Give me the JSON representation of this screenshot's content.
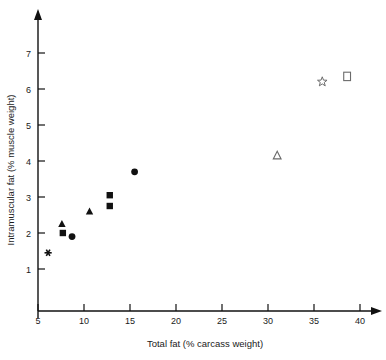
{
  "chart_data": {
    "type": "scatter",
    "title": "",
    "xlabel": "Total fat (% carcass weight)",
    "ylabel": "Intramuscular fat (% muscle weight)",
    "xlim": [
      5,
      41.5
    ],
    "ylim": [
      0.55,
      7.6
    ],
    "xticks": [
      5,
      10,
      15,
      20,
      25,
      30,
      35,
      40
    ],
    "xtick_labels": [
      "5",
      "10",
      "15",
      "20",
      "25",
      "30",
      "35",
      "40"
    ],
    "yticks": [
      1,
      2,
      3,
      4,
      5,
      6,
      7
    ],
    "ytick_labels": [
      "1",
      "2",
      "3",
      "4",
      "5",
      "6",
      "7"
    ],
    "grid": false,
    "legend": "none",
    "axis_arrows": true,
    "points": [
      {
        "x": 6.1,
        "y": 1.45,
        "marker": "asterisk-filled"
      },
      {
        "x": 7.6,
        "y": 2.25,
        "marker": "triangle-filled"
      },
      {
        "x": 7.7,
        "y": 2.0,
        "marker": "square-filled"
      },
      {
        "x": 8.7,
        "y": 1.9,
        "marker": "circle-filled"
      },
      {
        "x": 10.6,
        "y": 2.6,
        "marker": "triangle-filled"
      },
      {
        "x": 12.8,
        "y": 3.05,
        "marker": "square-filled"
      },
      {
        "x": 12.8,
        "y": 2.75,
        "marker": "square-filled"
      },
      {
        "x": 15.5,
        "y": 3.7,
        "marker": "circle-filled"
      },
      {
        "x": 31.0,
        "y": 4.15,
        "marker": "triangle-open"
      },
      {
        "x": 35.9,
        "y": 6.2,
        "marker": "star-open"
      },
      {
        "x": 38.6,
        "y": 6.35,
        "marker": "square-open"
      }
    ]
  }
}
